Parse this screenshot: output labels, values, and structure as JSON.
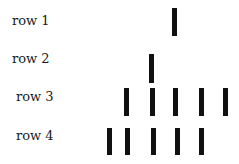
{
  "rows": [
    {
      "label": "row 1",
      "label_x": 12,
      "label_y": 14,
      "bar_top": 8,
      "bar_height": 28,
      "bars_x": [
        172
      ]
    },
    {
      "label": "row 2",
      "label_x": 12,
      "label_y": 52,
      "bar_top": 54,
      "bar_height": 29,
      "bars_x": [
        149
      ]
    },
    {
      "label": "row 3",
      "label_x": 16,
      "label_y": 90,
      "bar_top": 88,
      "bar_height": 28,
      "bars_x": [
        124,
        150,
        173,
        199,
        223
      ]
    },
    {
      "label": "row 4",
      "label_x": 16,
      "label_y": 129,
      "bar_top": 128,
      "bar_height": 27,
      "bars_x": [
        107,
        125,
        151,
        175,
        199
      ]
    }
  ],
  "bar_color": "#111111"
}
